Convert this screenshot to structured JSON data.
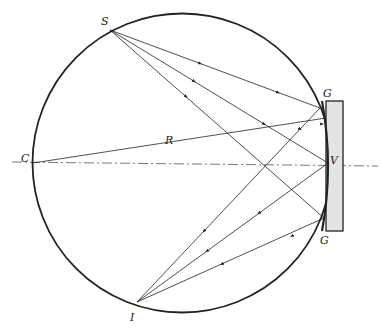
{
  "diagram": {
    "labels": {
      "source": "S",
      "image": "I",
      "center": "C",
      "vertex": "V",
      "radius": "R",
      "grating_top": "G",
      "grating_bottom": "G"
    },
    "colors": {
      "stroke": "#222222",
      "plate_fill": "#e4e4e4",
      "axis": "#555555"
    },
    "points": {
      "S": [
        110,
        30
      ],
      "I": [
        137,
        302
      ],
      "C": [
        33,
        163
      ],
      "V": [
        330,
        163
      ]
    }
  }
}
